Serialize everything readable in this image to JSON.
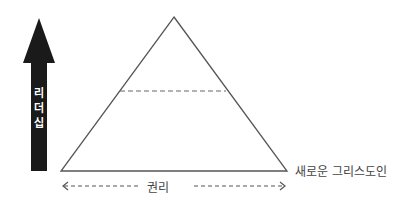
{
  "diagram": {
    "type": "pyramid",
    "vertical_arrow": {
      "label": "리더십",
      "direction": "up",
      "color": "#1a1a1a"
    },
    "horizontal_arrow": {
      "label": "권리",
      "direction": "both",
      "style": "dashed"
    },
    "pyramid": {
      "stroke": "#555555",
      "divider_style": "dashed"
    },
    "base_label": "새로운 그리스도인"
  }
}
